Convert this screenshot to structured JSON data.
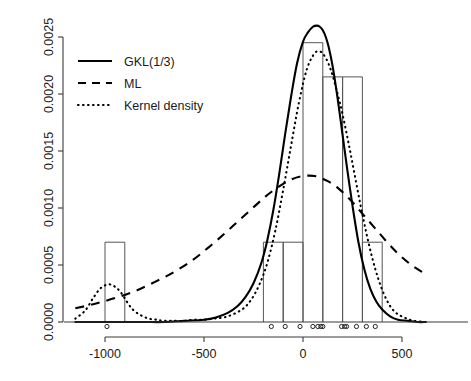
{
  "chart_data": {
    "type": "area",
    "title": "",
    "subtitle": "",
    "xlabel": "",
    "ylabel": "",
    "xlim": [
      -1150,
      620
    ],
    "ylim": [
      0.0,
      0.00265
    ],
    "grid": false,
    "legend_position": "top-left",
    "x_ticks": [
      -1000,
      -500,
      0,
      500
    ],
    "x_tick_labels": [
      "-1000",
      "-500",
      "0",
      "500"
    ],
    "y_ticks": [
      0.0,
      0.0005,
      0.001,
      0.0015,
      0.002,
      0.0025
    ],
    "y_tick_labels": [
      "0.0000",
      "0.0005",
      "0.0010",
      "0.0015",
      "0.0020",
      "0.0025"
    ],
    "legend": [
      {
        "name": "GKL(1/3)",
        "style": "solid"
      },
      {
        "name": "ML",
        "style": "dashed"
      },
      {
        "name": "Kernel density",
        "style": "dotted"
      }
    ],
    "histogram": {
      "bin_edges": [
        -1000,
        -900,
        -200,
        -100,
        0,
        100,
        200,
        300,
        400
      ],
      "bin_densities": [
        0.0007,
        0.0,
        0.0007,
        0.0007,
        0.00245,
        0.00215,
        0.00215,
        0.0007
      ]
    },
    "series": [
      {
        "name": "GKL(1/3)",
        "style": "solid",
        "x": [
          -1150,
          -1000,
          -900,
          -800,
          -700,
          -600,
          -500,
          -440,
          -380,
          -330,
          -290,
          -250,
          -210,
          -180,
          -150,
          -120,
          -90,
          -60,
          -30,
          0,
          25,
          50,
          70,
          85,
          100,
          115,
          130,
          150,
          175,
          200,
          225,
          250,
          280,
          310,
          340,
          370,
          400,
          440,
          480,
          530,
          580,
          620
        ],
        "y": [
          0.0,
          0.0,
          0.0,
          0.0,
          0.0,
          1e-05,
          2e-05,
          4e-05,
          8e-05,
          0.00014,
          0.00022,
          0.00034,
          0.00052,
          0.00072,
          0.00098,
          0.0013,
          0.00165,
          0.00198,
          0.00227,
          0.00246,
          0.00254,
          0.00259,
          0.0026,
          0.00259,
          0.00256,
          0.0025,
          0.00241,
          0.00224,
          0.00196,
          0.00164,
          0.00132,
          0.00102,
          0.0007,
          0.00046,
          0.00029,
          0.00018,
          0.00011,
          5e-05,
          2e-05,
          1e-05,
          0.0,
          0.0
        ]
      },
      {
        "name": "ML",
        "style": "dashed",
        "x": [
          -1150,
          -1050,
          -950,
          -850,
          -750,
          -650,
          -560,
          -480,
          -400,
          -330,
          -260,
          -190,
          -120,
          -60,
          0,
          60,
          120,
          180,
          240,
          300,
          360,
          420,
          480,
          540,
          600,
          620
        ],
        "y": [
          0.00012,
          0.00016,
          0.00021,
          0.00027,
          0.00035,
          0.00044,
          0.00054,
          0.00065,
          0.00077,
          0.00088,
          0.00099,
          0.0011,
          0.00119,
          0.00125,
          0.00128,
          0.00128,
          0.00124,
          0.00117,
          0.00107,
          0.00095,
          0.00083,
          0.00071,
          0.0006,
          0.00051,
          0.00044,
          0.00042
        ]
      },
      {
        "name": "Kernel density",
        "style": "dotted",
        "x": [
          -1150,
          -1100,
          -1060,
          -1020,
          -980,
          -950,
          -920,
          -890,
          -860,
          -820,
          -780,
          -740,
          -700,
          -650,
          -600,
          -550,
          -500,
          -450,
          -400,
          -350,
          -300,
          -260,
          -220,
          -180,
          -140,
          -100,
          -60,
          -20,
          20,
          60,
          90,
          110,
          130,
          150,
          175,
          200,
          230,
          260,
          290,
          320,
          350,
          380,
          410,
          440,
          470,
          510,
          560,
          620
        ],
        "y": [
          3e-05,
          0.0001,
          0.00021,
          0.0003,
          0.00033,
          0.00031,
          0.00026,
          0.00018,
          0.00011,
          6e-05,
          3e-05,
          2e-05,
          1e-05,
          1e-05,
          1e-05,
          2e-05,
          2e-05,
          3e-05,
          4e-05,
          7e-05,
          0.00012,
          0.0002,
          0.00033,
          0.00052,
          0.0008,
          0.00116,
          0.00155,
          0.00193,
          0.00222,
          0.00236,
          0.00237,
          0.00233,
          0.00226,
          0.00216,
          0.002,
          0.00182,
          0.00157,
          0.0013,
          0.00103,
          0.00078,
          0.00056,
          0.00038,
          0.00024,
          0.00014,
          8e-05,
          4e-05,
          1e-05,
          0.0
        ]
      }
    ],
    "rug": {
      "marker": "circle",
      "values": [
        -990,
        -160,
        -90,
        -15,
        50,
        75,
        90,
        100,
        195,
        210,
        220,
        270,
        320,
        365
      ]
    }
  }
}
